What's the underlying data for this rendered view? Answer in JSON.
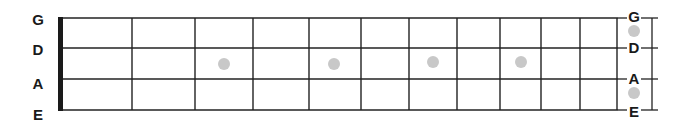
{
  "diagram": {
    "type": "bass-fretboard",
    "strings_left_labels": [
      "G",
      "D",
      "A",
      "E"
    ],
    "strings_right_labels": [
      "G",
      "D",
      "A",
      "E"
    ],
    "colors": {
      "line": "#222222",
      "nut": "#1a1a1a",
      "dot": "#c8c8c8",
      "label": "#1a1a1a"
    },
    "geometry": {
      "string_y": [
        18,
        48,
        79,
        110
      ],
      "nut_x": 58,
      "nut_width": 5,
      "board_right_x": 618,
      "fret_x": [
        132,
        195,
        253,
        309,
        361,
        409,
        457,
        500,
        541,
        580,
        617
      ],
      "left_label_x": 38,
      "left_label_y": [
        25,
        55,
        89,
        120
      ],
      "right_label_x": 634,
      "right_label_y": [
        22,
        53,
        84,
        117
      ],
      "bracket_x": 652
    },
    "inlay_dots": [
      {
        "x": 224,
        "y": 64
      },
      {
        "x": 334,
        "y": 64
      },
      {
        "x": 433,
        "y": 62
      },
      {
        "x": 521,
        "y": 62
      }
    ],
    "side_dots": [
      {
        "x": 634,
        "y": 31
      },
      {
        "x": 634,
        "y": 93
      }
    ]
  }
}
